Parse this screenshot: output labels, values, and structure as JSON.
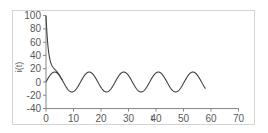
{
  "chart_data": {
    "type": "line",
    "title": "",
    "xlabel": "t",
    "ylabel": "i(t)",
    "xlim": [
      0,
      70
    ],
    "ylim": [
      -40,
      100
    ],
    "x_ticks": [
      0,
      10,
      20,
      30,
      40,
      50,
      60,
      70
    ],
    "y_ticks": [
      100,
      80,
      60,
      40,
      20,
      0,
      -20,
      -40
    ],
    "x_tick_labels": [
      "0",
      "10",
      "20",
      "30",
      "40",
      "50",
      "60",
      "70"
    ],
    "y_tick_labels": [
      "100",
      "80",
      "60",
      "40",
      "20",
      "0",
      "-20",
      "-40"
    ],
    "grid": false,
    "legend": null,
    "series": [
      {
        "name": "steady-state sinusoid",
        "description": "approx 15*sin(t/2), period ~12.6",
        "x": [
          0,
          3.1,
          9.4,
          15.7,
          22.0,
          28.3,
          34.6,
          40.8,
          47.1,
          53.4,
          58
        ],
        "values": [
          0,
          15,
          -15,
          15,
          -15,
          15,
          -15,
          15,
          -15,
          15,
          -12
        ],
        "color": "#404040"
      },
      {
        "name": "total response (transient decay + sinusoid)",
        "description": "starts at 100, decays quickly and merges with sinusoid near t=4",
        "x": [
          0,
          0.3,
          0.7,
          1.0,
          1.5,
          2.0,
          3.0,
          4.0
        ],
        "values": [
          100,
          76,
          55,
          44,
          28,
          22,
          20,
          15
        ],
        "color": "#404040"
      }
    ],
    "axis_color": "#868686",
    "frame_color": "#d4d4d4",
    "line_color": "#404040"
  }
}
